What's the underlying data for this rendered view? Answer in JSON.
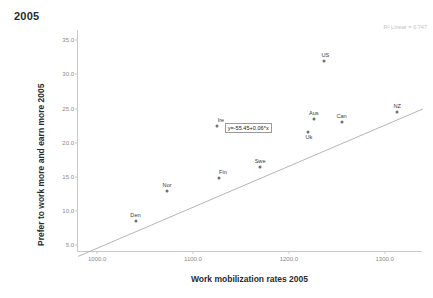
{
  "chart_data": {
    "type": "scatter",
    "title": "2005",
    "xlabel": "Work mobilization rates 2005",
    "ylabel": "Prefer to work more and earn more 2005",
    "xlim": [
      980,
      1340
    ],
    "ylim": [
      4.0,
      36.5
    ],
    "xticks": [
      "1000.0",
      "1100.0",
      "1200.0",
      "1300.0"
    ],
    "xtick_values": [
      1000,
      1100,
      1200,
      1300
    ],
    "yticks": [
      "5.0",
      "10.0",
      "15.0",
      "20.0",
      "25.0",
      "30.0",
      "35.0"
    ],
    "ytick_values": [
      5,
      10,
      15,
      20,
      25,
      30,
      35
    ],
    "grid": false,
    "legend": "none",
    "points": [
      {
        "label": "Den",
        "x": 1040,
        "y": 8.5,
        "label_dx": 0,
        "label_dy": -3
      },
      {
        "label": "Nor",
        "x": 1073,
        "y": 13.0,
        "label_dx": 0,
        "label_dy": -3
      },
      {
        "label": "Fin",
        "x": 1127,
        "y": 14.8,
        "label_dx": 4,
        "label_dy": -3
      },
      {
        "label": "Swe",
        "x": 1170,
        "y": 16.5,
        "label_dx": 0,
        "label_dy": -3
      },
      {
        "label": "Ire",
        "x": 1125,
        "y": 22.5,
        "label_dx": 4,
        "label_dy": -3
      },
      {
        "label": "Uk",
        "x": 1220,
        "y": 21.5,
        "label_dx": 1,
        "label_dy": 8
      },
      {
        "label": "Aus",
        "x": 1226,
        "y": 23.5,
        "label_dx": 0,
        "label_dy": -3
      },
      {
        "label": "Can",
        "x": 1255,
        "y": 23.0,
        "label_dx": 0,
        "label_dy": -3
      },
      {
        "label": "US",
        "x": 1237,
        "y": 32.0,
        "label_dx": 1,
        "label_dy": -3
      },
      {
        "label": "NZ",
        "x": 1313,
        "y": 24.5,
        "label_dx": 0,
        "label_dy": -3
      }
    ],
    "fit_line": {
      "equation_label": "y=-55.45+0.06*x",
      "intercept": -55.45,
      "slope": 0.06,
      "x_start": 980,
      "x_end": 1340,
      "color": "#b5b5b5"
    },
    "r_squared_label": "R² Linear = 0.747",
    "point_color": "#6f6f6f",
    "axis_color": "#c8c8c8",
    "tick_text_color": "#8a8a8a"
  }
}
